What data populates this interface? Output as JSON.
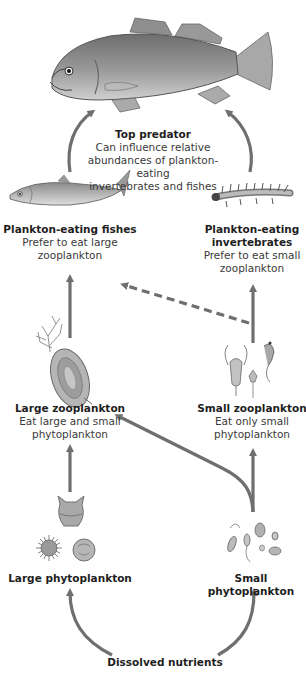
{
  "diagram": {
    "type": "food-web",
    "arrow_color": "#6f6f6f",
    "nodes": {
      "top_predator": {
        "title": "Top predator",
        "desc_lines": [
          "Can influence relative",
          "abundances of plankton-eating",
          "invertebrates and fishes"
        ],
        "icon": "largemouth-bass-fish"
      },
      "plankton_fishes": {
        "title": "Plankton-eating fishes",
        "desc_lines": [
          "Prefer to eat large",
          "zooplankton"
        ],
        "icon": "small-silver-fish"
      },
      "plankton_invertebrates": {
        "title_lines": [
          "Plankton-eating",
          "invertebrates"
        ],
        "desc_lines": [
          "Prefer to eat small",
          "zooplankton"
        ],
        "icon": "insect-larva"
      },
      "large_zooplankton": {
        "title": "Large zooplankton",
        "desc_lines": [
          "Eat large and small",
          "phytoplankton"
        ],
        "icon": "large-zooplankton-organism"
      },
      "small_zooplankton": {
        "title": "Small zooplankton",
        "desc_lines": [
          "Eat only small",
          "phytoplankton"
        ],
        "icon": "small-zooplankton-organisms"
      },
      "large_phytoplankton": {
        "title": "Large phytoplankton",
        "icon": "large-phytoplankton-cells"
      },
      "small_phytoplankton": {
        "title": "Small phytoplankton",
        "icon": "small-phytoplankton-cells"
      },
      "nutrients": {
        "title": "Dissolved nutrients"
      }
    },
    "edges": [
      {
        "from": "Dissolved nutrients",
        "to": "Large phytoplankton",
        "style": "solid"
      },
      {
        "from": "Dissolved nutrients",
        "to": "Small phytoplankton",
        "style": "solid"
      },
      {
        "from": "Large phytoplankton",
        "to": "Large zooplankton",
        "style": "solid"
      },
      {
        "from": "Small phytoplankton",
        "to": "Large zooplankton",
        "style": "solid"
      },
      {
        "from": "Small phytoplankton",
        "to": "Small zooplankton",
        "style": "solid"
      },
      {
        "from": "Large zooplankton",
        "to": "Plankton-eating fishes",
        "style": "solid"
      },
      {
        "from": "Small zooplankton",
        "to": "Plankton-eating invertebrates",
        "style": "solid"
      },
      {
        "from": "Small zooplankton",
        "to": "Plankton-eating fishes",
        "style": "dashed"
      },
      {
        "from": "Plankton-eating fishes",
        "to": "Top predator",
        "style": "solid"
      },
      {
        "from": "Plankton-eating invertebrates",
        "to": "Top predator",
        "style": "solid"
      }
    ]
  }
}
